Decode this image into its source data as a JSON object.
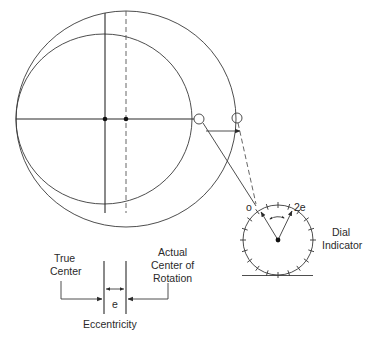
{
  "diagram": {
    "type": "eccentricity measurement schematic",
    "labels": {
      "zero_mark": "o",
      "full_deflection": "2e",
      "dial_line1": "Dial",
      "dial_line2": "Indicator",
      "true_center_line1": "True",
      "true_center_line2": "Center",
      "actual_center_line1": "Actual",
      "actual_center_line2": "Center of",
      "actual_center_line3": "Rotation",
      "e_symbol": "e",
      "eccentricity": "Eccentricity"
    },
    "elements": [
      {
        "name": "inner-circle",
        "description": "Part circle about true center"
      },
      {
        "name": "outer-circle",
        "description": "Path traced about actual center of rotation"
      },
      {
        "name": "true-center-axis",
        "style": "solid"
      },
      {
        "name": "actual-center-axis",
        "style": "dashed"
      },
      {
        "name": "probe-contact-min",
        "description": "Probe contact at minimum runout"
      },
      {
        "name": "probe-contact-max",
        "description": "Probe contact at maximum runout"
      },
      {
        "name": "dial-indicator",
        "ticks": 20,
        "pointer_positions": [
          "o",
          "2e"
        ]
      }
    ],
    "colors": {
      "line": "#3a3a3a",
      "background": "#ffffff"
    }
  }
}
